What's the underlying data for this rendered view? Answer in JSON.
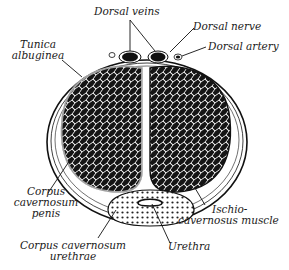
{
  "figure": {
    "colors": {
      "ink": "#111111",
      "background": "#ffffff",
      "tissue_light": "#f2f2f2"
    }
  },
  "labels": {
    "dorsal_veins": "Dorsal veins",
    "dorsal_nerve": "Dorsal nerve",
    "dorsal_artery": "Dorsal artery",
    "tunica_line1": "Tunica",
    "tunica_line2": "albuginea",
    "ccp_line1": "Corpus",
    "ccp_line2": "cavernosum",
    "ccp_line3": "penis",
    "ischio_line1": "Ischio-",
    "ischio_line2": "cavernosus muscle",
    "ccu_line1": "Corpus cavernosum",
    "ccu_line2": "urethrae",
    "urethra": "Urethra"
  }
}
